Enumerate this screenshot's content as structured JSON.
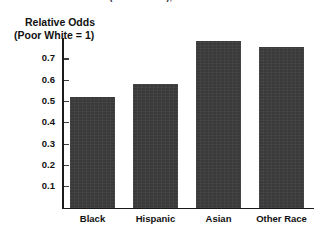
{
  "clipped_title": "Income Effect (versus White), Income Poor Individuals",
  "chart_data": {
    "type": "bar",
    "title": "",
    "xlabel": "",
    "ylabel": "Relative Odds (Poor White = 1)",
    "ylabel_line1": "Relative Odds",
    "ylabel_line2": "(Poor White = 1)",
    "categories": [
      "Black",
      "Hispanic",
      "Asian",
      "Other Race"
    ],
    "values": [
      0.52,
      0.58,
      0.78,
      0.755
    ],
    "ylim": [
      0,
      0.8
    ],
    "yticks": [
      0.7,
      0.6,
      0.5,
      0.4,
      0.3,
      0.2,
      0.1
    ],
    "ytick_labels": [
      "0.7",
      "0.6",
      "0.5",
      "0.4",
      "0.3",
      "0.2",
      "0.1"
    ],
    "grid": false,
    "legend": false,
    "bar_color": "#3a3a3a",
    "axis_color": "#1a1a1a"
  }
}
